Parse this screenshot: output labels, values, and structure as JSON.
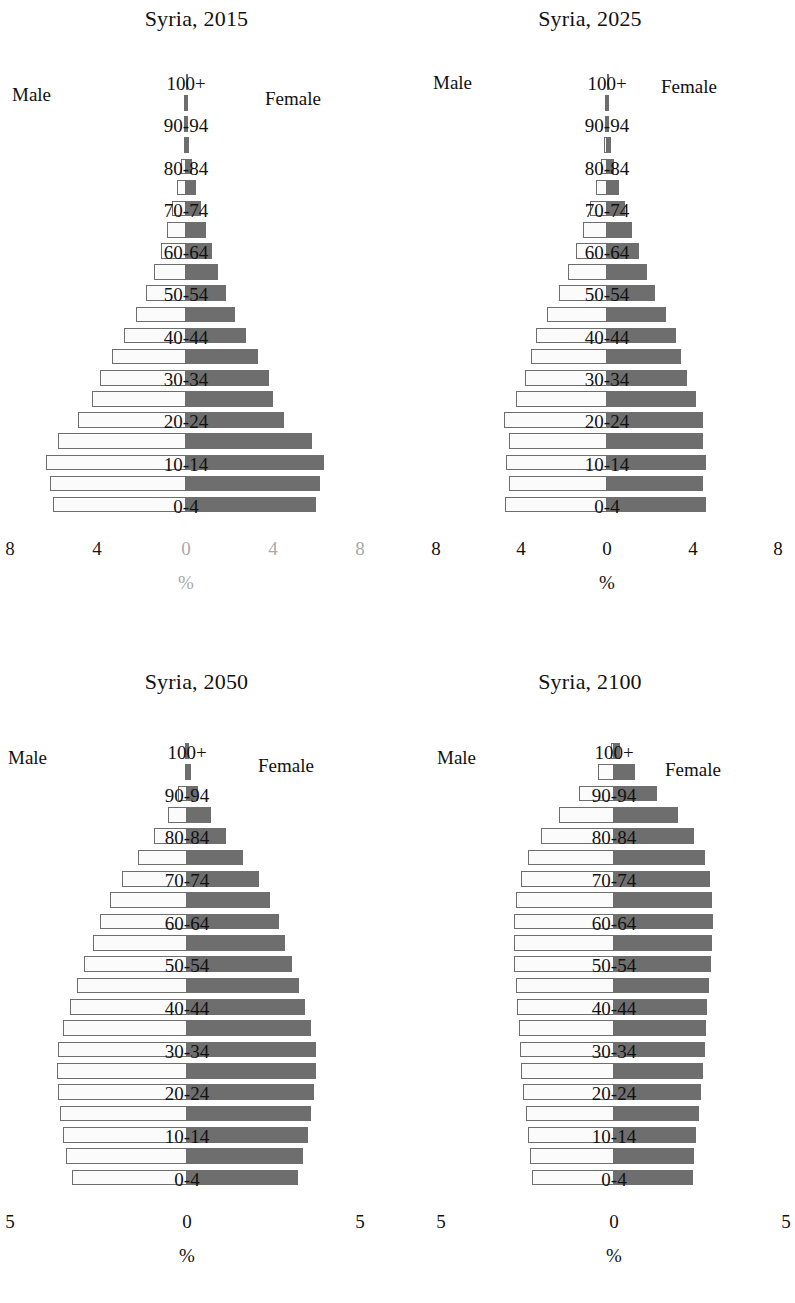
{
  "panels": [
    {
      "title": "Syria, 2015",
      "male_label": "Male",
      "female_label": "Female",
      "pct_label": "%",
      "axis_ticks": [
        "8",
        "4",
        "0",
        "4",
        "8"
      ],
      "axis_max": 8,
      "tick_color": "#a8a8a8",
      "dark_ticks": [
        0,
        1
      ],
      "chart_data": {
        "type": "bar",
        "title": "Syria, 2015",
        "xlabel": "%",
        "ylabel": "",
        "xlim": [
          -8,
          8
        ],
        "grid": false,
        "legend_position": "top",
        "categories": [
          "0-4",
          "5-9",
          "10-14",
          "15-19",
          "20-24",
          "25-29",
          "30-34",
          "35-39",
          "40-44",
          "45-49",
          "50-54",
          "55-59",
          "60-64",
          "65-69",
          "70-74",
          "75-79",
          "80-84",
          "85-89",
          "90-94",
          "95-99",
          "100+"
        ],
        "series": [
          {
            "name": "Male",
            "values": [
              6.1,
              6.25,
              6.4,
              5.85,
              4.95,
              4.3,
              3.95,
              3.4,
              2.85,
              2.3,
              1.85,
              1.45,
              1.15,
              0.85,
              0.62,
              0.4,
              0.22,
              0.1,
              0.04,
              0.01,
              0.0
            ]
          },
          {
            "name": "Female",
            "values": [
              5.95,
              6.15,
              6.35,
              5.8,
              4.5,
              4.0,
              3.8,
              3.3,
              2.75,
              2.25,
              1.85,
              1.45,
              1.2,
              0.9,
              0.68,
              0.45,
              0.26,
              0.12,
              0.05,
              0.01,
              0.0
            ]
          }
        ]
      }
    },
    {
      "title": "Syria, 2025",
      "male_label": "Male",
      "female_label": "Female",
      "pct_label": "%",
      "axis_ticks": [
        "8",
        "4",
        "0",
        "4",
        "8"
      ],
      "axis_max": 8,
      "tick_color": "#1a1a1a",
      "dark_ticks": [
        0,
        1,
        2,
        3,
        4
      ],
      "chart_data": {
        "type": "bar",
        "title": "Syria, 2025",
        "xlabel": "%",
        "ylabel": "",
        "xlim": [
          -8,
          8
        ],
        "grid": false,
        "legend_position": "top",
        "categories": [
          "0-4",
          "5-9",
          "10-14",
          "15-19",
          "20-24",
          "25-29",
          "30-34",
          "35-39",
          "40-44",
          "45-49",
          "50-54",
          "55-59",
          "60-64",
          "65-69",
          "70-74",
          "75-79",
          "80-84",
          "85-89",
          "90-94",
          "95-99",
          "100+"
        ],
        "series": [
          {
            "name": "Male",
            "values": [
              4.75,
              4.55,
              4.7,
              4.55,
              4.8,
              4.25,
              3.8,
              3.55,
              3.3,
              2.8,
              2.25,
              1.8,
              1.45,
              1.1,
              0.78,
              0.52,
              0.3,
              0.14,
              0.05,
              0.01,
              0.0
            ]
          },
          {
            "name": "Female",
            "values": [
              4.6,
              4.45,
              4.6,
              4.45,
              4.45,
              4.15,
              3.7,
              3.45,
              3.2,
              2.75,
              2.25,
              1.85,
              1.5,
              1.18,
              0.86,
              0.58,
              0.34,
              0.17,
              0.06,
              0.01,
              0.0
            ]
          }
        ]
      }
    },
    {
      "title": "Syria, 2050",
      "male_label": "Male",
      "female_label": "Female",
      "pct_label": "%",
      "axis_ticks": [
        "5",
        "0",
        "5"
      ],
      "axis_max": 5,
      "tick_color": "#1a1a1a",
      "dark_ticks": [
        0,
        1,
        2
      ],
      "chart_data": {
        "type": "bar",
        "title": "Syria, 2050",
        "xlabel": "%",
        "ylabel": "",
        "xlim": [
          -5,
          5
        ],
        "grid": false,
        "legend_position": "top",
        "categories": [
          "0-4",
          "5-9",
          "10-14",
          "15-19",
          "20-24",
          "25-29",
          "30-34",
          "35-39",
          "40-44",
          "45-49",
          "50-54",
          "55-59",
          "60-64",
          "65-69",
          "70-74",
          "75-79",
          "80-84",
          "85-89",
          "90-94",
          "95-99",
          "100+"
        ],
        "series": [
          {
            "name": "Male",
            "values": [
              3.3,
              3.45,
              3.55,
              3.62,
              3.7,
              3.72,
              3.7,
              3.55,
              3.35,
              3.15,
              2.95,
              2.7,
              2.5,
              2.2,
              1.85,
              1.4,
              0.95,
              0.55,
              0.25,
              0.07,
              0.01
            ]
          },
          {
            "name": "Female",
            "values": [
              3.18,
              3.32,
              3.45,
              3.55,
              3.62,
              3.68,
              3.68,
              3.55,
              3.38,
              3.2,
              3.0,
              2.8,
              2.62,
              2.38,
              2.05,
              1.6,
              1.12,
              0.68,
              0.32,
              0.1,
              0.02
            ]
          }
        ]
      }
    },
    {
      "title": "Syria, 2100",
      "male_label": "Male",
      "female_label": "Female",
      "pct_label": "%",
      "axis_ticks": [
        "5",
        "0",
        "5"
      ],
      "axis_max": 5,
      "tick_color": "#1a1a1a",
      "dark_ticks": [
        0,
        1,
        2
      ],
      "chart_data": {
        "type": "bar",
        "title": "Syria, 2100",
        "xlabel": "%",
        "ylabel": "",
        "xlim": [
          -5,
          5
        ],
        "grid": false,
        "legend_position": "top",
        "categories": [
          "0-4",
          "5-9",
          "10-14",
          "15-19",
          "20-24",
          "25-29",
          "30-34",
          "35-39",
          "40-44",
          "45-49",
          "50-54",
          "55-59",
          "60-64",
          "65-69",
          "70-74",
          "75-79",
          "80-84",
          "85-89",
          "90-94",
          "95-99",
          "100+"
        ],
        "series": [
          {
            "name": "Male",
            "values": [
              2.38,
              2.42,
              2.48,
              2.55,
              2.62,
              2.68,
              2.72,
              2.76,
              2.8,
              2.84,
              2.88,
              2.9,
              2.88,
              2.82,
              2.7,
              2.48,
              2.1,
              1.6,
              1.0,
              0.45,
              0.1
            ]
          },
          {
            "name": "Female",
            "values": [
              2.28,
              2.32,
              2.38,
              2.45,
              2.52,
              2.58,
              2.62,
              2.66,
              2.7,
              2.74,
              2.8,
              2.84,
              2.86,
              2.84,
              2.78,
              2.62,
              2.32,
              1.86,
              1.25,
              0.62,
              0.16
            ]
          }
        ]
      }
    }
  ]
}
